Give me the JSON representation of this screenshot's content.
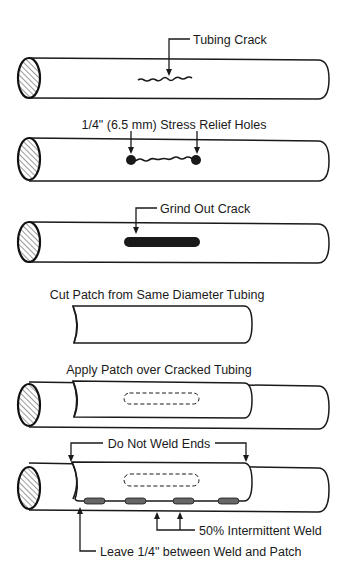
{
  "diagram": {
    "steps": [
      {
        "id": 1,
        "label": "Tubing Crack"
      },
      {
        "id": 2,
        "label": "1/4\" (6.5 mm) Stress Relief Holes"
      },
      {
        "id": 3,
        "label": "Grind Out Crack"
      },
      {
        "id": 4,
        "label": "Cut Patch from Same Diameter Tubing"
      },
      {
        "id": 5,
        "label": "Apply Patch over Cracked Tubing"
      },
      {
        "id": 6,
        "label": "Do Not Weld Ends",
        "callouts": [
          "50% Intermittent Weld",
          "Leave 1/4\" between Weld and Patch"
        ]
      }
    ],
    "colors": {
      "line": "#1a1a1a",
      "background": "#ffffff",
      "weld": "#666666"
    }
  }
}
